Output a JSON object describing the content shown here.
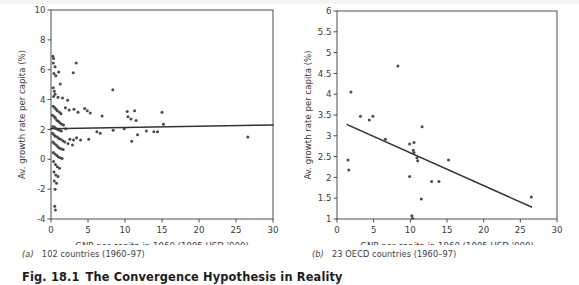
{
  "figure": {
    "number": "Fig. 18.1",
    "title": "The Convergence Hypothesis in Reality",
    "background_color": "#ffffff",
    "ink_color": "#3a3a3a",
    "point_color": "#4a4a4a",
    "line_color": "#333333"
  },
  "panels": [
    {
      "id": "a",
      "label": "(a)",
      "caption": "102 countries (1960–97)",
      "chart_data": {
        "type": "scatter",
        "title": "",
        "subtitle": "",
        "xlabel": "GNP per capita in 1960 (1995 USD '000)",
        "ylabel": "Av. growth rate per capita (%)",
        "xlim": [
          0,
          30
        ],
        "ylim": [
          -4,
          10
        ],
        "xticks": [
          0,
          5,
          10,
          15,
          20,
          25,
          30
        ],
        "yticks": [
          -4,
          -2,
          0,
          2,
          4,
          6,
          8,
          10
        ],
        "xticklabels": [
          "0",
          "5",
          "10",
          "15",
          "20",
          "25",
          "30"
        ],
        "yticklabels": [
          "-4",
          "-2",
          "0",
          "2",
          "4",
          "6",
          "8",
          "10"
        ],
        "grid": false,
        "legend": "none",
        "series": [
          {
            "name": "102 countries",
            "marker": "dot",
            "points": [
              [
                0.25,
                6.9
              ],
              [
                0.35,
                6.75
              ],
              [
                0.3,
                6.45
              ],
              [
                0.55,
                6.2
              ],
              [
                0.4,
                5.75
              ],
              [
                0.65,
                5.6
              ],
              [
                1.05,
                5.85
              ],
              [
                1.25,
                5.05
              ],
              [
                0.3,
                4.8
              ],
              [
                0.45,
                4.55
              ],
              [
                0.55,
                4.35
              ],
              [
                0.35,
                4.2
              ],
              [
                0.95,
                4.15
              ],
              [
                1.55,
                4.1
              ],
              [
                2.25,
                3.95
              ],
              [
                3.4,
                6.45
              ],
              [
                3.0,
                5.8
              ],
              [
                8.35,
                4.65
              ],
              [
                0.3,
                3.55
              ],
              [
                0.5,
                3.45
              ],
              [
                0.7,
                3.35
              ],
              [
                0.85,
                3.25
              ],
              [
                1.15,
                3.15
              ],
              [
                1.35,
                3.05
              ],
              [
                1.95,
                3.45
              ],
              [
                2.45,
                3.3
              ],
              [
                3.1,
                3.35
              ],
              [
                3.65,
                3.15
              ],
              [
                4.55,
                3.4
              ],
              [
                4.9,
                3.25
              ],
              [
                5.3,
                3.1
              ],
              [
                6.9,
                2.9
              ],
              [
                10.3,
                3.2
              ],
              [
                11.3,
                3.25
              ],
              [
                15.0,
                3.15
              ],
              [
                11.5,
                2.6
              ],
              [
                10.4,
                2.85
              ],
              [
                10.8,
                2.7
              ],
              [
                0.2,
                2.95
              ],
              [
                0.45,
                2.85
              ],
              [
                0.6,
                2.75
              ],
              [
                0.8,
                2.6
              ],
              [
                1.0,
                2.55
              ],
              [
                1.2,
                2.45
              ],
              [
                1.45,
                2.35
              ],
              [
                1.7,
                2.3
              ],
              [
                0.25,
                2.2
              ],
              [
                0.5,
                2.15
              ],
              [
                0.75,
                2.05
              ],
              [
                0.95,
                2.0
              ],
              [
                1.15,
                1.95
              ],
              [
                1.4,
                1.9
              ],
              [
                2.0,
                2.05
              ],
              [
                2.55,
                1.35
              ],
              [
                3.05,
                1.3
              ],
              [
                3.45,
                1.45
              ],
              [
                4.0,
                1.3
              ],
              [
                5.1,
                1.35
              ],
              [
                6.2,
                1.85
              ],
              [
                6.65,
                1.75
              ],
              [
                8.4,
                1.95
              ],
              [
                9.9,
                2.05
              ],
              [
                11.7,
                1.65
              ],
              [
                10.9,
                1.2
              ],
              [
                12.9,
                1.9
              ],
              [
                13.9,
                1.85
              ],
              [
                14.4,
                1.85
              ],
              [
                15.2,
                2.35
              ],
              [
                26.6,
                1.5
              ],
              [
                0.2,
                1.75
              ],
              [
                0.4,
                1.65
              ],
              [
                0.6,
                1.55
              ],
              [
                0.85,
                1.5
              ],
              [
                1.05,
                1.4
              ],
              [
                1.3,
                1.35
              ],
              [
                1.6,
                1.25
              ],
              [
                1.85,
                1.15
              ],
              [
                2.3,
                1.05
              ],
              [
                2.9,
                0.95
              ],
              [
                0.25,
                1.15
              ],
              [
                0.45,
                1.05
              ],
              [
                0.7,
                0.95
              ],
              [
                0.9,
                0.85
              ],
              [
                1.1,
                0.75
              ],
              [
                1.35,
                0.7
              ],
              [
                1.65,
                0.65
              ],
              [
                0.3,
                0.45
              ],
              [
                0.55,
                0.35
              ],
              [
                0.8,
                0.25
              ],
              [
                1.0,
                0.15
              ],
              [
                1.25,
                0.1
              ],
              [
                1.5,
                0.05
              ],
              [
                0.35,
                -0.15
              ],
              [
                0.6,
                -0.35
              ],
              [
                0.85,
                -0.5
              ],
              [
                1.15,
                -0.6
              ],
              [
                0.4,
                -0.85
              ],
              [
                0.65,
                -1.05
              ],
              [
                0.95,
                -1.15
              ],
              [
                0.45,
                -1.45
              ],
              [
                0.75,
                -1.6
              ],
              [
                0.55,
                -2.0
              ],
              [
                0.5,
                -3.15
              ],
              [
                0.6,
                -3.4
              ]
            ]
          }
        ],
        "trendline": {
          "name": "regression line",
          "x_start": 0,
          "y_start": 2.05,
          "x_end": 30,
          "y_end": 2.3,
          "slope_sign": "flat"
        },
        "annotation": "Essentially flat relationship — no unconditional convergence"
      }
    },
    {
      "id": "b",
      "label": "(b)",
      "caption": "23 OECD countries (1960–97)",
      "chart_data": {
        "type": "scatter",
        "title": "",
        "subtitle": "",
        "xlabel": "GNP per capita in 1960 (1995 USD '000)",
        "ylabel": "Av. growth rate per capita (%)",
        "xlim": [
          0,
          30
        ],
        "ylim": [
          1,
          6
        ],
        "xticks": [
          0,
          5,
          10,
          15,
          20,
          25,
          30
        ],
        "yticks": [
          1,
          1.5,
          2,
          2.5,
          3,
          3.5,
          4,
          4.5,
          5,
          5.5,
          6
        ],
        "xticklabels": [
          "0",
          "5",
          "10",
          "15",
          "20",
          "25",
          "30"
        ],
        "yticklabels": [
          "1",
          "1.5",
          "2",
          "2.5",
          "3",
          "3.5",
          "4",
          "4.5",
          "5",
          "5.5",
          "6"
        ],
        "grid": false,
        "legend": "none",
        "series": [
          {
            "name": "23 OECD countries",
            "marker": "dot",
            "points": [
              [
                1.5,
                2.42
              ],
              [
                1.6,
                2.18
              ],
              [
                1.9,
                4.05
              ],
              [
                3.2,
                3.47
              ],
              [
                4.4,
                3.38
              ],
              [
                4.9,
                3.47
              ],
              [
                6.6,
                2.92
              ],
              [
                8.3,
                4.68
              ],
              [
                9.9,
                2.8
              ],
              [
                10.5,
                2.84
              ],
              [
                10.4,
                2.65
              ],
              [
                10.5,
                2.6
              ],
              [
                10.9,
                2.47
              ],
              [
                11.6,
                3.22
              ],
              [
                9.9,
                2.02
              ],
              [
                11.5,
                1.48
              ],
              [
                12.9,
                1.9
              ],
              [
                13.9,
                1.9
              ],
              [
                15.2,
                2.42
              ],
              [
                10.2,
                1.08
              ],
              [
                10.3,
                1.02
              ],
              [
                26.5,
                1.53
              ],
              [
                11.0,
                2.4
              ]
            ]
          }
        ],
        "trendline": {
          "name": "regression line",
          "x_start": 1.4,
          "y_start": 3.27,
          "x_end": 26.5,
          "y_end": 1.29,
          "slope_sign": "negative"
        },
        "annotation": "Clear downward slope — convergence among OECD countries"
      }
    }
  ]
}
